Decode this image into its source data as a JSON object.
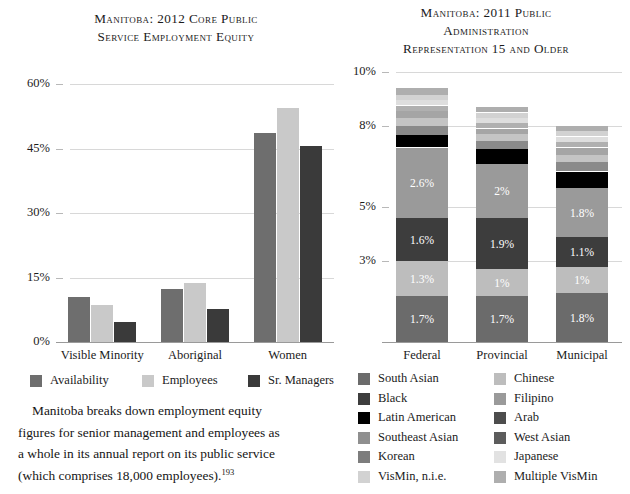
{
  "left_chart": {
    "title_lines": [
      "Manitoba: 2012 Core Public",
      "Service Employment Equity"
    ],
    "y_ticks": [
      "60%",
      "45%",
      "30%",
      "15%",
      "0%"
    ],
    "categories": [
      "Visible Minority",
      "Aboriginal",
      "Women"
    ],
    "legend": [
      {
        "label": "Availability",
        "color": "#6e6e6e"
      },
      {
        "label": "Employees",
        "color": "#c9c9c9"
      },
      {
        "label": "Sr. Managers",
        "color": "#3a3a3a"
      }
    ]
  },
  "right_chart": {
    "title_lines": [
      "Manitoba: 2011 Public",
      "Administration",
      "Representation 15 and Older"
    ],
    "y_ticks": [
      "10%",
      "8%",
      "5%",
      "3%"
    ],
    "categories": [
      "Federal",
      "Provincial",
      "Municipal"
    ],
    "legend_col1": [
      {
        "label": "South Asian",
        "color": "#6b6b6b"
      },
      {
        "label": "Black",
        "color": "#3d3d3d"
      },
      {
        "label": "Latin American",
        "color": "#000000"
      },
      {
        "label": "Southeast Asian",
        "color": "#8f8f8f"
      },
      {
        "label": "Korean",
        "color": "#7d7d7d"
      },
      {
        "label": "VisMin, n.i.e.",
        "color": "#d2d2d2"
      }
    ],
    "legend_col2": [
      {
        "label": "Chinese",
        "color": "#bdbdbd"
      },
      {
        "label": "Filipino",
        "color": "#9a9a9a"
      },
      {
        "label": "Arab",
        "color": "#4d4d4d"
      },
      {
        "label": "West Asian",
        "color": "#5c5c5c"
      },
      {
        "label": "Japanese",
        "color": "#e2e2e2"
      },
      {
        "label": "Multiple VisMin",
        "color": "#aeaeae"
      }
    ]
  },
  "body_text": {
    "line1": "Manitoba breaks down employment equity",
    "line2": "figures for senior management and employees as",
    "line3": "a whole in its annual report on its public service",
    "line4": "(which comprises 18,000 employees).",
    "footnote": "193"
  },
  "chart_data": [
    {
      "type": "bar",
      "title": "Manitoba: 2012 Core Public Service Employment Equity",
      "xlabel": "",
      "ylabel": "",
      "ylim": [
        0,
        60
      ],
      "yticks": [
        0,
        15,
        30,
        45,
        60
      ],
      "grid": true,
      "legend_position": "bottom",
      "categories": [
        "Visible Minority",
        "Aboriginal",
        "Women"
      ],
      "series": [
        {
          "name": "Availability",
          "color": "#6e6e6e",
          "values": [
            10.5,
            12.3,
            48.5
          ]
        },
        {
          "name": "Employees",
          "color": "#c9c9c9",
          "values": [
            8.6,
            13.8,
            54.5
          ]
        },
        {
          "name": "Sr. Managers",
          "color": "#3a3a3a",
          "values": [
            4.6,
            7.7,
            45.5
          ]
        }
      ]
    },
    {
      "type": "bar",
      "stacked": true,
      "title": "Manitoba: 2011 Public Administration Representation 15 and Older",
      "xlabel": "",
      "ylabel": "",
      "ylim": [
        0,
        10
      ],
      "yticks": [
        3,
        5,
        8,
        10
      ],
      "grid": true,
      "legend_position": "bottom",
      "categories": [
        "Federal",
        "Provincial",
        "Municipal"
      ],
      "series": [
        {
          "name": "South Asian",
          "color": "#6b6b6b",
          "values": [
            1.7,
            1.7,
            1.8
          ],
          "labels": [
            "1.7%",
            "1.7%",
            "1.8%"
          ]
        },
        {
          "name": "Chinese",
          "color": "#bdbdbd",
          "values": [
            1.3,
            1.0,
            1.0
          ],
          "labels": [
            "1.3%",
            "1%",
            "1%"
          ]
        },
        {
          "name": "Black",
          "color": "#3d3d3d",
          "values": [
            1.6,
            1.9,
            1.1
          ],
          "labels": [
            "1.6%",
            "1.9%",
            "1.1%"
          ]
        },
        {
          "name": "Filipino",
          "color": "#9a9a9a",
          "values": [
            2.6,
            2.0,
            1.8
          ],
          "labels": [
            "2.6%",
            "2%",
            "1.8%"
          ]
        },
        {
          "name": "Latin American",
          "color": "#000000",
          "values": [
            0.45,
            0.55,
            0.6
          ],
          "labels": [
            "",
            "",
            ""
          ]
        },
        {
          "name": "Arab",
          "color": "#8a8a8a",
          "values": [
            0.35,
            0.3,
            0.35
          ],
          "labels": [
            "",
            "",
            ""
          ]
        },
        {
          "name": "Southeast Asian",
          "color": "#c4c4c4",
          "values": [
            0.3,
            0.25,
            0.3
          ],
          "labels": [
            "",
            "",
            ""
          ]
        },
        {
          "name": "West Asian",
          "color": "#a5a5a5",
          "values": [
            0.25,
            0.2,
            0.25
          ],
          "labels": [
            "",
            "",
            ""
          ]
        },
        {
          "name": "Korean",
          "color": "#b0b0b0",
          "values": [
            0.2,
            0.2,
            0.2
          ],
          "labels": [
            "",
            "",
            ""
          ]
        },
        {
          "name": "Japanese",
          "color": "#dedede",
          "values": [
            0.2,
            0.2,
            0.2
          ],
          "labels": [
            "",
            "",
            ""
          ]
        },
        {
          "name": "VisMin, n.i.e.",
          "color": "#d2d2d2",
          "values": [
            0.2,
            0.2,
            0.2
          ],
          "labels": [
            "",
            "",
            ""
          ]
        },
        {
          "name": "Multiple VisMin",
          "color": "#aeaeae",
          "values": [
            0.25,
            0.2,
            0.2
          ],
          "labels": [
            "",
            "",
            ""
          ]
        }
      ],
      "totals": [
        9.4,
        8.9,
        8.0
      ]
    }
  ]
}
